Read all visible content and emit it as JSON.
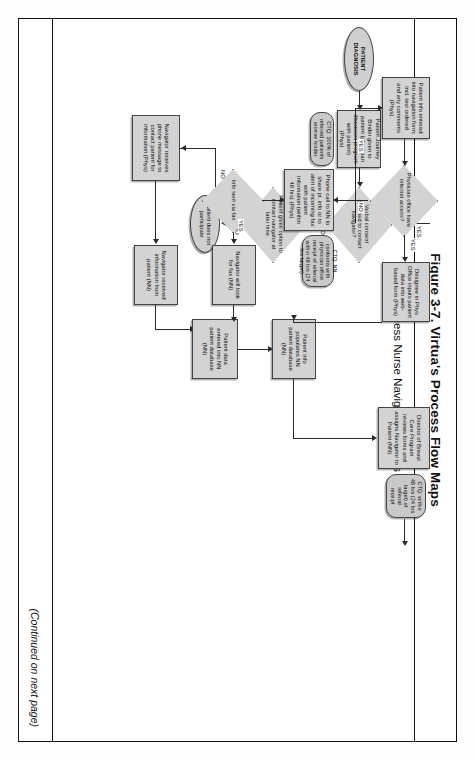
{
  "figure": {
    "title": "Figure 3-7. Virtua's Process Flow Maps",
    "subtitle": "Ease of Access Nurse Navigator Process Map",
    "continued_note": "(Continued on next page)"
  },
  "nodes": {
    "patient_diagnosis": "PATIENT DIAGNOSIS",
    "journey_binder": "Patient Journey Binder given to patient (physician discusses program with patient) (Phys)",
    "ctq_binder": "CTQ: 100% of referred patients receive binder",
    "verbal_consent": "Verbal consent obtained to contact navigator?",
    "patient_option": "Patient given option to contact navigator at later time",
    "patient_not_participate": "Patient does not participate",
    "navigator_receives_msg": "Navigator receives phone message to contact patient for information (Phys)",
    "navigator_received_info": "Navigator received information from patient (NN)",
    "navigator_look_fax": "Navigator will look for fax (NN)",
    "patient_data_entered": "Patient data entered into NN patient database (NN)",
    "patient_info_populates": "Patient info populates NN patient database (NN)",
    "info_sent_via_fax": "Info sent via fax",
    "phone_call_nn": "Phone call to NN to share pt. info or to alert of incoming fax with patient information (within 48 hrs) (Phys)",
    "ctq_nn_conforms": "CTQ: NN conforms with physician office receipt of referral within 48 hrs (24 hrs target)",
    "physician_internet": "Physician office have internet access?",
    "patient_info_entered": "Patient info entered into navigation form; incl. test ordered and any comments (Phys)",
    "designee_inputs": "Designee in Phys Office inputs patient data into web-based form (Phys)",
    "director_breast_care": "Director of Breast Care Program reviews forms and assigns Navigator to Patient (NN)",
    "ctq_director": "CTQ: within 48 hrs (24 hrs target) of referral receipt"
  },
  "edge_labels": {
    "consent_no": "NO",
    "consent_yes": "YES",
    "option_no": "NO",
    "option_no2": "NO",
    "fax_yes": "YES",
    "fax_no": "NO",
    "internet_yes": "YES",
    "internet_no": "NO",
    "top_yes": "YES"
  },
  "colors": {
    "box_fill": "#d3d3d3",
    "ctq_fill": "#c9c9c9",
    "stroke": "#444444",
    "line": "#2a2a2a",
    "text": "#0d0d0d"
  }
}
